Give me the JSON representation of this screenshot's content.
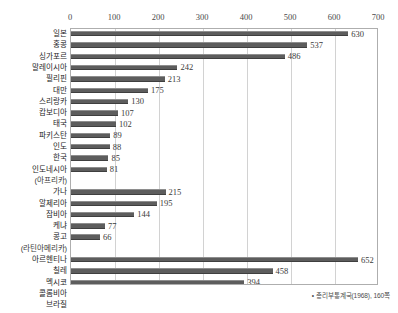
{
  "chart_data": {
    "type": "bar",
    "orientation": "horizontal",
    "title": "",
    "subtitle": "",
    "xlabel": "",
    "ylabel": "",
    "xlim": [
      0,
      700
    ],
    "xticks": [
      0,
      100,
      200,
      300,
      400,
      500,
      600,
      700
    ],
    "xtick_labels": [
      "0",
      "100",
      "200",
      "300",
      "400",
      "500",
      "600",
      "700"
    ],
    "grid": true,
    "grid_axis": "x",
    "legend": false,
    "legend_position": "none",
    "bar_color": "#5d5d5d",
    "categories": [
      "일본",
      "홍콩",
      "싱가포르",
      "말레이시아",
      "필리핀",
      "대만",
      "스리랑카",
      "캄보디아",
      "태국",
      "파키스탄",
      "인도",
      "한국",
      "인도네시아",
      "(아프리카)",
      "가나",
      "알제리아",
      "잠비아",
      "케냐",
      "콩고",
      "(라틴아메리카)",
      "아르헨티나",
      "칠레",
      "멕시코",
      "콜롬비아",
      "브라질"
    ],
    "values": [
      630,
      537,
      486,
      242,
      213,
      175,
      130,
      107,
      102,
      89,
      88,
      85,
      81,
      null,
      215,
      195,
      144,
      77,
      66,
      null,
      652,
      458,
      394,
      235,
      180
    ],
    "value_labels": [
      "630",
      "537",
      "486",
      "242",
      "213",
      "175",
      "130",
      "107",
      "102",
      "89",
      "88",
      "85",
      "81",
      "",
      "215",
      "195",
      "144",
      "77",
      "66",
      "",
      "652",
      "458",
      "394",
      "235",
      "180"
    ],
    "group_rows": [
      13,
      19
    ],
    "annotations": []
  },
  "footnote": {
    "bullet": "•",
    "text": "총리부통계국(1968), 160쪽"
  }
}
